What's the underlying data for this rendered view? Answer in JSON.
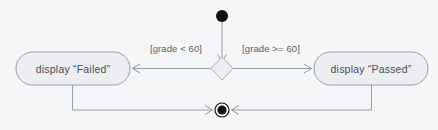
{
  "diagram": {
    "type": "uml-activity-diagram",
    "background_color": "#f4f6f8",
    "line_color": "#9aa0a6",
    "node_fill": "#eceef1",
    "node_stroke": "#9aa0a6",
    "text_color": "#4a4f55",
    "marker_color": "#111111",
    "nodes": {
      "initial": {
        "name": "initial-node",
        "kind": "initial",
        "label": ""
      },
      "decision": {
        "name": "decision-node",
        "kind": "decision",
        "label": ""
      },
      "action_failed": {
        "name": "action-display-failed",
        "kind": "action",
        "label": "display “Failed”"
      },
      "action_passed": {
        "name": "action-display-passed",
        "kind": "action",
        "label": "display “Passed”"
      },
      "final": {
        "name": "final-node",
        "kind": "activity-final",
        "label": ""
      }
    },
    "transitions": [
      {
        "name": "flow-initial-to-decision",
        "from": "initial",
        "to": "decision",
        "guard": ""
      },
      {
        "name": "flow-decision-to-failed",
        "from": "decision",
        "to": "action_failed",
        "guard": "[grade < 60]"
      },
      {
        "name": "flow-decision-to-passed",
        "from": "decision",
        "to": "action_passed",
        "guard": "[grade >= 60]"
      },
      {
        "name": "flow-failed-to-final",
        "from": "action_failed",
        "to": "final",
        "guard": ""
      },
      {
        "name": "flow-passed-to-final",
        "from": "action_passed",
        "to": "final",
        "guard": ""
      }
    ],
    "guards": {
      "left": "[grade < 60]",
      "right": "[grade >= 60]"
    }
  }
}
